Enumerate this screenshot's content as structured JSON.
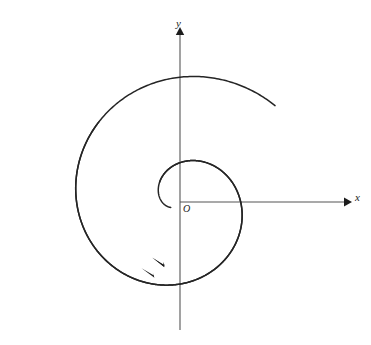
{
  "figure": {
    "background_color": "#ffffff",
    "width": 371,
    "height": 345
  },
  "labels": {
    "y_axis": "y",
    "x_axis": "x",
    "origin": "O"
  },
  "colors": {
    "curve": "#252525",
    "axis": "#555555",
    "axis_left_tint": "#8fb9a8",
    "axis_left_tint2": "#7e93c0",
    "arrowhead": "#1c1c1c",
    "label": "#1c1c1c"
  },
  "chart_data": {
    "type": "line",
    "xlabel": "x",
    "ylabel": "y",
    "grid": false,
    "legend": null,
    "annotations": [
      {
        "text": "y",
        "x": 180,
        "y": 25,
        "role": "axis-label"
      },
      {
        "text": "x",
        "x": 357,
        "y": 198,
        "role": "axis-label"
      },
      {
        "text": "O",
        "x": 186,
        "y": 210,
        "role": "origin-label"
      }
    ],
    "axes": {
      "origin_px": [
        180,
        202
      ],
      "x_axis": {
        "from_px": [
          25,
          202
        ],
        "to_px": [
          348,
          202
        ],
        "arrow_at": "end"
      },
      "y_axis": {
        "from_px": [
          180,
          330
        ],
        "to_px": [
          180,
          30
        ],
        "arrow_at": "end"
      }
    },
    "series": [
      {
        "name": "spiral-outer-arm",
        "kind": "archimedean",
        "description": "r = a + b*theta, traced clockwise inward toward origin",
        "a_px": 6,
        "b_px": 13.6,
        "theta_start_deg": 545,
        "theta_end_deg": 20,
        "crossings": {
          "x_axis_right_px": [
            202,
            214,
            227,
            259,
            286
          ],
          "x_axis_left_px": [
            152,
            135,
            120,
            76,
            52
          ],
          "y_axis_top_px": [
            178,
            162,
            143,
            119,
            92
          ],
          "y_axis_bottom_px": [
            243,
            262,
            280
          ]
        },
        "endpoint_px": [
          88,
          314
        ]
      },
      {
        "name": "spiral-inner-arm",
        "kind": "archimedean",
        "description": "second interleaved arm of the spiral",
        "a_px": 6,
        "b_px": 13.6,
        "theta_start_deg": 455,
        "theta_end_deg": 95,
        "endpoint_px": [
          113,
          282
        ]
      }
    ],
    "arrowheads": [
      {
        "x_px": 157,
        "y_px": 261,
        "direction_deg": 205,
        "on": "spiral-inner-arm"
      },
      {
        "x_px": 147,
        "y_px": 272,
        "direction_deg": 205,
        "on": "spiral-outer-arm"
      },
      {
        "x_px": 348,
        "y_px": 202,
        "direction_deg": 0,
        "on": "x-axis"
      },
      {
        "x_px": 180,
        "y_px": 30,
        "direction_deg": 270,
        "on": "y-axis"
      }
    ]
  }
}
